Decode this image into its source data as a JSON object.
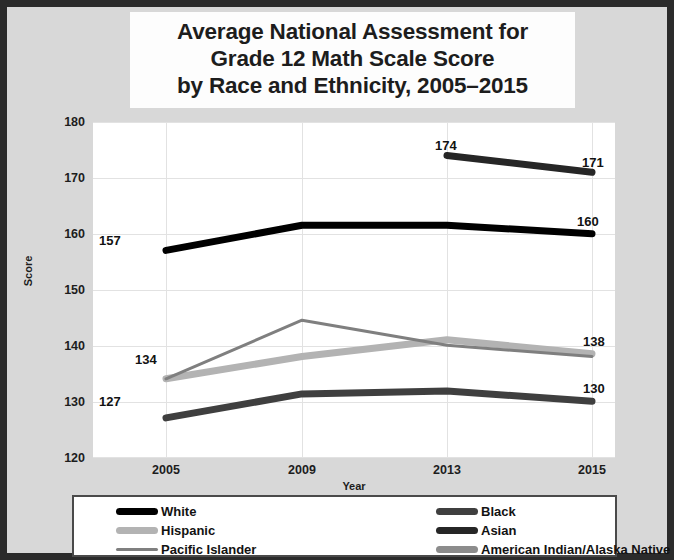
{
  "title": {
    "line1": "Average National Assessment for",
    "line2": "Grade 12 Math Scale Score",
    "line3": "by Race and Ethnicity, 2005–2015"
  },
  "axes": {
    "ylabel": "Score",
    "xlabel": "Year",
    "yticks": [
      "180",
      "170",
      "160",
      "150",
      "140",
      "130",
      "120"
    ],
    "xticks": [
      "2005",
      "2009",
      "2013",
      "2015"
    ]
  },
  "legend": {
    "items": [
      {
        "label": "White",
        "color": "#000000",
        "width": 7
      },
      {
        "label": "Black",
        "color": "#3f3f3f",
        "width": 7
      },
      {
        "label": "Hispanic",
        "color": "#b3b3b3",
        "width": 7
      },
      {
        "label": "Asian",
        "color": "#262626",
        "width": 7
      },
      {
        "label": "Pacific Islander",
        "color": "#7f7f7f",
        "width": 3
      },
      {
        "label": "American Indian/Alaska Native",
        "color": "#8c8c8c",
        "width": 7
      }
    ]
  },
  "point_labels": [
    {
      "text": "157",
      "x": 92,
      "y": 226
    },
    {
      "text": "160",
      "x": 570,
      "y": 207
    },
    {
      "text": "174",
      "x": 428,
      "y": 131
    },
    {
      "text": "171",
      "x": 575,
      "y": 148
    },
    {
      "text": "134",
      "x": 128,
      "y": 345
    },
    {
      "text": "138",
      "x": 576,
      "y": 327
    },
    {
      "text": "127",
      "x": 92,
      "y": 387
    },
    {
      "text": "130",
      "x": 576,
      "y": 374
    }
  ],
  "chart_data": {
    "type": "line",
    "title": "Average National Assessment for Grade 12 Math Scale Score by Race and Ethnicity, 2005–2015",
    "xlabel": "Year",
    "ylabel": "Score",
    "categories": [
      "2005",
      "2009",
      "2013",
      "2015"
    ],
    "x": [
      2005,
      2009,
      2013,
      2015
    ],
    "ylim": [
      120,
      180
    ],
    "yticks": [
      120,
      130,
      140,
      150,
      160,
      170,
      180
    ],
    "grid": true,
    "legend_position": "bottom",
    "series": [
      {
        "name": "White",
        "color": "#000000",
        "values": [
          157,
          161.5,
          161.5,
          160
        ],
        "data_labels": {
          "2005": "157",
          "2015": "160"
        }
      },
      {
        "name": "Black",
        "color": "#3f3f3f",
        "values": [
          127,
          131.3,
          131.8,
          130
        ],
        "data_labels": {
          "2005": "127",
          "2015": "130"
        }
      },
      {
        "name": "Hispanic",
        "color": "#b3b3b3",
        "values": [
          134,
          138,
          141,
          138.5
        ],
        "data_labels": {}
      },
      {
        "name": "Asian",
        "color": "#262626",
        "values": [
          null,
          null,
          174,
          171
        ],
        "data_labels": {
          "2013": "174",
          "2015": "171"
        }
      },
      {
        "name": "Pacific Islander",
        "color": "#7f7f7f",
        "values": [
          134,
          144.5,
          140,
          138
        ],
        "data_labels": {
          "2005": "134",
          "2015": "138"
        }
      },
      {
        "name": "American Indian/Alaska Native",
        "color": "#8c8c8c",
        "values": [
          null,
          null,
          null,
          null
        ],
        "data_labels": {}
      }
    ]
  }
}
